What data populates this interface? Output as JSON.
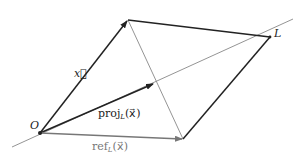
{
  "labels": {
    "origin": "O",
    "line": "L",
    "x_vec": "x⃗",
    "proj_prefix": "proj",
    "proj_sub": "L",
    "proj_arg": "(x⃗)",
    "ref_prefix": "ref",
    "ref_sub": "L",
    "ref_arg": "(x⃗)"
  },
  "colors": {
    "dark": "#222222",
    "gray": "#888888"
  },
  "points": {
    "O": [
      40,
      133
    ],
    "x_tip": [
      128,
      20
    ],
    "L_corner": [
      270,
      37
    ],
    "ref_tip": [
      183,
      139
    ],
    "proj_tip": [
      154,
      84
    ],
    "line_start": [
      12,
      147
    ],
    "line_end": [
      293,
      19
    ]
  }
}
